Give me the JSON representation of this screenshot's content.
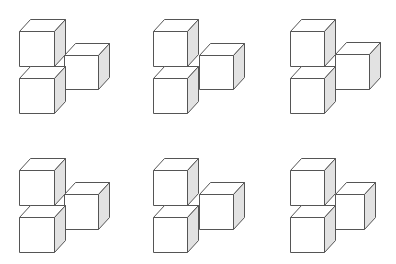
{
  "title": "",
  "colors": {
    "background": "#ffffff",
    "stroke": "#555555",
    "front_face": "#ffffff",
    "top_face": "#ffffff",
    "side_face": "#e2e2e2"
  },
  "depth": {
    "dx": 11,
    "dy": -12
  },
  "figures": [
    {
      "id": "figure-1",
      "cubes": [
        {
          "name": "top-left-cube",
          "x": 19,
          "y": 31,
          "w": 35,
          "h": 35
        },
        {
          "name": "bottom-left-cube",
          "x": 19,
          "y": 78,
          "w": 35,
          "h": 35
        },
        {
          "name": "right-cube",
          "x": 64,
          "y": 55,
          "w": 34,
          "h": 34
        }
      ]
    },
    {
      "id": "figure-2",
      "cubes": [
        {
          "name": "top-left-cube",
          "x": 153,
          "y": 31,
          "w": 34,
          "h": 35
        },
        {
          "name": "bottom-left-cube",
          "x": 153,
          "y": 78,
          "w": 34,
          "h": 35
        },
        {
          "name": "right-cube",
          "x": 199,
          "y": 55,
          "w": 34,
          "h": 34
        }
      ]
    },
    {
      "id": "figure-3",
      "cubes": [
        {
          "name": "top-left-cube",
          "x": 290,
          "y": 31,
          "w": 34,
          "h": 35
        },
        {
          "name": "bottom-left-cube",
          "x": 290,
          "y": 78,
          "w": 34,
          "h": 35
        },
        {
          "name": "right-cube",
          "x": 335,
          "y": 54,
          "w": 34,
          "h": 35
        }
      ]
    },
    {
      "id": "figure-4",
      "cubes": [
        {
          "name": "top-left-cube",
          "x": 19,
          "y": 170,
          "w": 35,
          "h": 35
        },
        {
          "name": "bottom-left-cube",
          "x": 19,
          "y": 217,
          "w": 35,
          "h": 35
        },
        {
          "name": "right-cube",
          "x": 64,
          "y": 194,
          "w": 34,
          "h": 35
        }
      ]
    },
    {
      "id": "figure-5",
      "cubes": [
        {
          "name": "top-left-cube",
          "x": 153,
          "y": 170,
          "w": 34,
          "h": 35
        },
        {
          "name": "bottom-left-cube",
          "x": 153,
          "y": 217,
          "w": 34,
          "h": 35
        },
        {
          "name": "right-cube",
          "x": 199,
          "y": 194,
          "w": 34,
          "h": 35
        }
      ]
    },
    {
      "id": "figure-6",
      "cubes": [
        {
          "name": "top-left-cube",
          "x": 290,
          "y": 170,
          "w": 34,
          "h": 35
        },
        {
          "name": "bottom-left-cube",
          "x": 290,
          "y": 217,
          "w": 34,
          "h": 35
        },
        {
          "name": "right-cube",
          "x": 335,
          "y": 194,
          "w": 29,
          "h": 35
        }
      ]
    }
  ]
}
